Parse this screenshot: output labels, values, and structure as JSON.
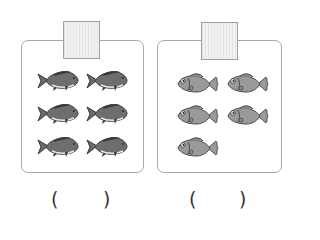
{
  "groups": [
    {
      "name": "left-group",
      "fish_type": "dark-gray-carp",
      "fish_count": 6,
      "label_box_text": "",
      "answer_open": "(",
      "answer_close": ")",
      "answer_value": ""
    },
    {
      "name": "right-group",
      "fish_type": "light-gray-fish",
      "fish_count": 5,
      "label_box_text": "",
      "answer_open": "(",
      "answer_close": ")",
      "answer_value": ""
    }
  ],
  "colors": {
    "panel_border": "#a8a8a8",
    "dark_fish_body": "#6e6e6e",
    "dark_fish_outline": "#3a3a3a",
    "light_fish_body": "#9a9a9a",
    "light_fish_outline": "#4a4a4a"
  }
}
